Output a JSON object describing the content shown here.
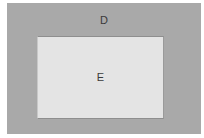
{
  "diagram": {
    "outer_box": {
      "label": "D",
      "fill": "#a9a9a9"
    },
    "inner_box": {
      "label": "E",
      "fill": "#e4e4e4"
    }
  }
}
